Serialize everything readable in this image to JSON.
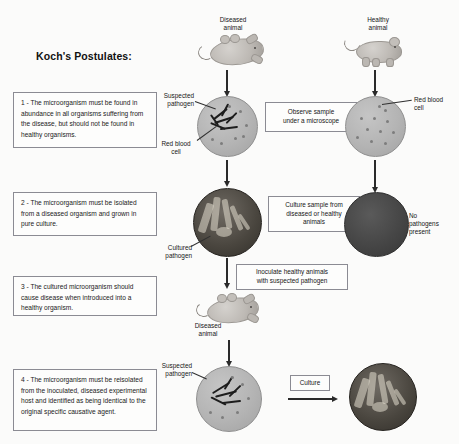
{
  "title": "Koch's Postulates:",
  "postulates": [
    {
      "id": "post1",
      "text": "1 - The microorganism must be found in abundance in all organisms suffering from the disease, but should not be found in healthy organisms."
    },
    {
      "id": "post2",
      "text": "2 - The microorganism must be isolated from a diseased organism and grown in pure culture."
    },
    {
      "id": "post3",
      "text": "3 - The cultured microorganism should cause disease when introduced into a healthy organism."
    },
    {
      "id": "post4",
      "text": "4 - The microorganism must be reisolated from the inoculated, diseased experimental host and identified as being identical to the original specific causative agent."
    }
  ],
  "labels": {
    "diseased_animal_top": "Diseased\nanimal",
    "healthy_animal_top": "Healthy\nanimal",
    "suspected_pathogen_top": "Suspected\npathogen",
    "red_blood_cell_left": "Red blood\ncell",
    "red_blood_cell_right": "Red blood\ncell",
    "cultured_pathogen": "Cultured\npathogen",
    "no_pathogens_present": "No\npathogens\npresent",
    "diseased_animal_bottom": "Diseased\nanimal",
    "suspected_pathogen_bottom": "Suspected\npathogen"
  },
  "process_boxes": {
    "observe": "Observe sample\nunder a microscope",
    "culture_sample": "Culture sample from\ndiseased or healthy\nanimals",
    "inoculate": "Inoculate healthy animals\nwith suspected pathogen",
    "culture": "Culture"
  },
  "colors": {
    "background": "#fbfbfa",
    "box_border": "#8b8b93",
    "arrow": "#2a2a2a",
    "dish_light": "#b4b4b4",
    "dish_dark": "#464646",
    "dish_culture": "#4a463f",
    "text": "#1c1c1c"
  }
}
